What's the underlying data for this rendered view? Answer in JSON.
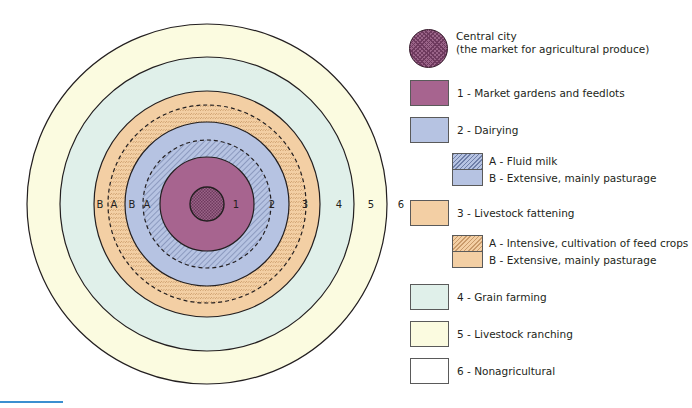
{
  "diagram": {
    "ring_labels": {
      "r3b": "B",
      "r3a": "A",
      "r2b": "B",
      "r2a": "A",
      "z1": "1",
      "z2": "2",
      "z3": "3",
      "z4": "4",
      "z5": "5",
      "z6": "6"
    },
    "colors": {
      "central_city": "#8a4a74",
      "zone1": "#a7648f",
      "zone2": "#b6c3e2",
      "zone3": "#f3cfa4",
      "zone4": "#e0f0ea",
      "zone5": "#fbfbe0",
      "zone6": "#ffffff",
      "outline": "#231f20",
      "accent_rule": "#3b8fd0"
    }
  },
  "legend": {
    "central_city": {
      "line1": "Central city",
      "line2": "(the market for agricultural produce)"
    },
    "items": [
      {
        "label": "1 - Market gardens and feedlots"
      },
      {
        "label": "2 - Dairying"
      },
      {
        "label": "3 - Livestock fattening"
      },
      {
        "label": "4 - Grain farming"
      },
      {
        "label": "5 - Livestock ranching"
      },
      {
        "label": "6 - Nonagricultural"
      }
    ],
    "dairying_sub": {
      "a": "A - Fluid milk",
      "b": "B - Extensive, mainly pasturage"
    },
    "fattening_sub": {
      "a": "A - Intensive, cultivation of feed crops",
      "b": "B - Extensive, mainly pasturage"
    }
  }
}
